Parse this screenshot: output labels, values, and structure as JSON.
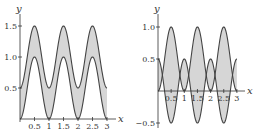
{
  "colors": {
    "fill": "#d6d6d6",
    "curve": "#444444",
    "axis": "#333333"
  },
  "chart_data": [
    {
      "type": "area",
      "title": "",
      "xlabel": "x",
      "ylabel": "y",
      "xlim": [
        0,
        3
      ],
      "ylim": [
        0,
        1.5
      ],
      "x_ticks": [
        "0.5",
        "1",
        "1.5",
        "2",
        "2.5",
        "3"
      ],
      "y_ticks": [
        "0.5",
        "1.0",
        "1.5"
      ],
      "grid": false,
      "series": [
        {
          "name": "lower",
          "formula": "sin^2(pi x)",
          "x": [
            0,
            0.5,
            1,
            1.5,
            2,
            2.5,
            3
          ],
          "values": [
            0,
            1.0,
            0,
            1.0,
            0,
            1.0,
            0
          ]
        },
        {
          "name": "upper",
          "formula": "sin^2(pi x) + 0.5",
          "x": [
            0,
            0.5,
            1,
            1.5,
            2,
            2.5,
            3
          ],
          "values": [
            0.5,
            1.5,
            0.5,
            1.5,
            0.5,
            1.5,
            0.5
          ]
        }
      ],
      "shaded_region": "between lower and upper"
    },
    {
      "type": "area",
      "title": "",
      "xlabel": "x",
      "ylabel": "y",
      "xlim": [
        0,
        3
      ],
      "ylim": [
        -0.5,
        1.0
      ],
      "x_ticks": [
        "0.5",
        "1",
        "1.5",
        "2",
        "2.5",
        "3"
      ],
      "y_ticks": [
        "−0.5",
        "0.5",
        "1.0"
      ],
      "grid": false,
      "series": [
        {
          "name": "f",
          "formula": "0.5 cos(2 pi x)",
          "x": [
            0,
            0.5,
            1,
            1.5,
            2,
            2.5,
            3
          ],
          "values": [
            0.5,
            -0.5,
            0.5,
            -0.5,
            0.5,
            -0.5,
            0.5
          ]
        },
        {
          "name": "g",
          "formula": "0.5 - 0.5 cos(2 pi x)",
          "x": [
            0,
            0.5,
            1,
            1.5,
            2,
            2.5,
            3
          ],
          "values": [
            0,
            1.0,
            0,
            1.0,
            0,
            1.0,
            0
          ]
        }
      ],
      "intersections_y": 0.25,
      "shaded_region": "between f and g"
    }
  ],
  "left": {
    "x_label": "x",
    "y_label": "y",
    "x_ticks": [
      "0.5",
      "1",
      "1.5",
      "2",
      "2.5",
      "3"
    ],
    "y_ticks": [
      "0.5",
      "1.0",
      "1.5"
    ]
  },
  "right": {
    "x_label": "x",
    "y_label": "y",
    "x_ticks": [
      "0.5",
      "1",
      "1.5",
      "2",
      "2.5",
      "3"
    ],
    "y_ticks": [
      "−0.5",
      "0.5",
      "1.0"
    ]
  }
}
